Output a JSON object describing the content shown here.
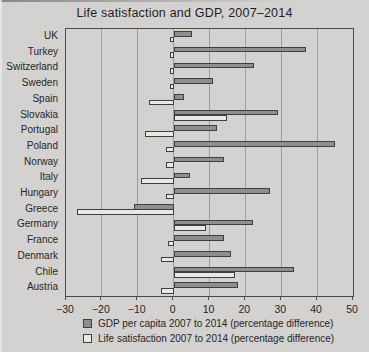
{
  "title": "Life satisfaction and GDP, 2007–2014",
  "colors": {
    "background": "#d3d2d0",
    "gdp_bar": "#8e8e8c",
    "life_satisfaction_bar": "#e9e8e5",
    "bar_border": "#3f3f3f",
    "gridline": "#9e9d9b",
    "text": "#262626"
  },
  "chart_data": {
    "type": "bar",
    "orientation": "horizontal",
    "title": "Life satisfaction and GDP, 2007–2014",
    "xlabel": "",
    "ylabel": "",
    "xlim": [
      -30,
      50
    ],
    "xticks": [
      -30,
      -20,
      -10,
      0,
      10,
      20,
      30,
      40,
      50
    ],
    "grid": true,
    "legend_position": "bottom",
    "categories": [
      "UK",
      "Turkey",
      "Switzerland",
      "Sweden",
      "Spain",
      "Slovakia",
      "Portugal",
      "Poland",
      "Norway",
      "Italy",
      "Hungary",
      "Greece",
      "Germany",
      "France",
      "Denmark",
      "Chile",
      "Austria"
    ],
    "series": [
      {
        "name": "GDP per capita 2007 to 2014 (percentage difference)",
        "color": "#8e8e8c",
        "values": [
          5,
          37,
          22.5,
          11,
          3,
          29,
          12,
          45,
          14,
          4.5,
          27,
          -11,
          22,
          14,
          16,
          33.5,
          18
        ]
      },
      {
        "name": "Life satisfaction 2007 to 2014 (percentage difference)",
        "color": "#e9e8e5",
        "values": [
          -1,
          -1,
          -1,
          -1,
          -7,
          15,
          -8,
          -2,
          -2,
          -9,
          -2,
          -27,
          9,
          -1.5,
          -3.5,
          17,
          -3.5
        ]
      }
    ]
  }
}
